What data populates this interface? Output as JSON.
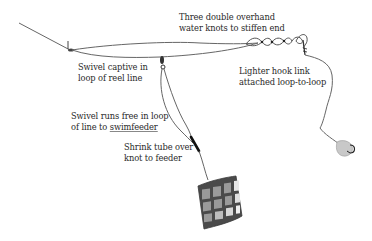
{
  "diagram": {
    "type": "fishing rig illustration",
    "labels": {
      "knots": {
        "line1": "Three double overhand",
        "line2": "water knots to stiffen end"
      },
      "swivel_captive": {
        "line1": "Swivel captive in",
        "line2": "loop of reel line"
      },
      "hook_link": {
        "line1": "Lighter hook link",
        "line2": "attached loop-to-loop"
      },
      "swivel_free": {
        "line1": "Swivel runs free in loop",
        "line2_prefix": "of line to ",
        "line2_underlined": "swimfeeder"
      },
      "shrink_tube": {
        "line1": "Shrink tube over",
        "line2": "knot to feeder"
      }
    },
    "components": [
      "reel-line",
      "captive-swivel",
      "running-swivel",
      "water-knots",
      "hook-link",
      "shrink-tube",
      "swimfeeder",
      "hook-with-bait"
    ],
    "colors": {
      "line": "#555555",
      "feeder_frame": "#4a4a4a",
      "feeder_panel": "#9a9a9a",
      "bait": "#c8c8c8",
      "shrink_tube": "#111111",
      "text": "#2a2a2a"
    }
  }
}
